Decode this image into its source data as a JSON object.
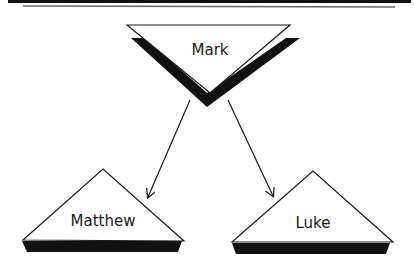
{
  "diagram": {
    "type": "synoptic-source-diagram",
    "nodes": [
      {
        "id": "mark",
        "label": "Mark",
        "shape": "inverted-triangle",
        "role": "source"
      },
      {
        "id": "matthew",
        "label": "Matthew",
        "shape": "triangle"
      },
      {
        "id": "luke",
        "label": "Luke",
        "shape": "triangle"
      }
    ],
    "edges": [
      {
        "from": "mark",
        "to": "matthew",
        "style": "arrow"
      },
      {
        "from": "mark",
        "to": "luke",
        "style": "arrow"
      }
    ],
    "colors": {
      "stroke": "#1a1a1a",
      "shadow": "#111111",
      "fill": "#ffffff",
      "rule_top": "#111111",
      "rule_bottom": "#555555"
    }
  }
}
